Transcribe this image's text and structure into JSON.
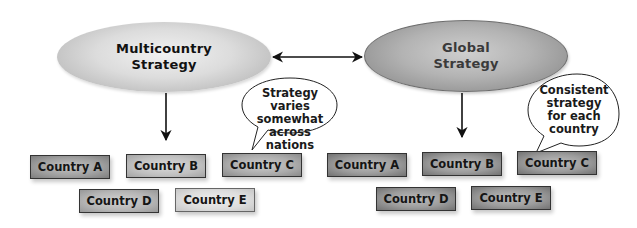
{
  "diagram": {
    "type": "comparison-flow",
    "nodes": {
      "multicountry": {
        "line1": "Multicountry",
        "line2": "Strategy"
      },
      "global": {
        "line1": "Global",
        "line2": "Strategy"
      }
    },
    "connector": {
      "type": "bidirectional-arrow",
      "between": [
        "Multicountry Strategy",
        "Global Strategy"
      ]
    },
    "callouts": {
      "multicountry": {
        "lines": [
          "Strategy varies",
          "somewhat",
          "across nations"
        ]
      },
      "global": {
        "lines": [
          "Consistent",
          "strategy",
          "for each",
          "country"
        ]
      }
    },
    "multicountry_countries": [
      {
        "label": "Country A",
        "fill": "#9e9e9e"
      },
      {
        "label": "Country B",
        "fill": "#bdbdbd"
      },
      {
        "label": "Country C",
        "fill": "#a8a8a8"
      },
      {
        "label": "Country D",
        "fill": "#b3b3b3"
      },
      {
        "label": "Country E",
        "fill": "#d9d9d9"
      }
    ],
    "global_countries": [
      {
        "label": "Country A"
      },
      {
        "label": "Country B"
      },
      {
        "label": "Country C"
      },
      {
        "label": "Country D"
      },
      {
        "label": "Country E"
      }
    ],
    "colors": {
      "arrow": "#111111",
      "box_border": "#333333",
      "global_box": "#9c9c9c"
    }
  }
}
